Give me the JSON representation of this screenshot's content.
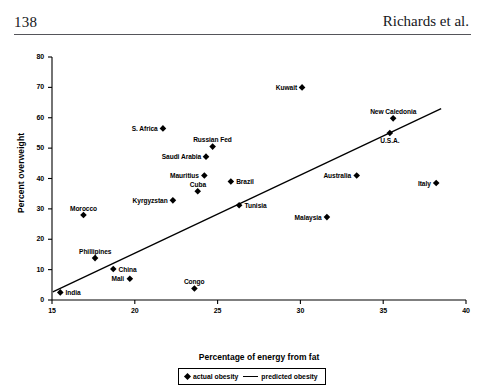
{
  "page": {
    "folio": "138",
    "running_head": "Richards et al."
  },
  "chart_data": {
    "type": "scatter",
    "title": "",
    "xlabel": "Percentage of energy from fat",
    "ylabel": "Percent overweight",
    "xlim": [
      15,
      40
    ],
    "ylim": [
      0,
      80
    ],
    "xticks": [
      "15",
      "20",
      "25",
      "30",
      "35",
      "40"
    ],
    "yticks": [
      "0",
      "10",
      "20",
      "30",
      "40",
      "50",
      "60",
      "70",
      "80"
    ],
    "grid": false,
    "legend_position": "bottom-center",
    "legend": [
      {
        "label": "actual obesity",
        "marker": "diamond"
      },
      {
        "label": "predicted obesity",
        "marker": "line"
      }
    ],
    "series": [
      {
        "name": "actual obesity",
        "marker": "diamond",
        "color": "#000000",
        "points": [
          {
            "label": "India",
            "x": 15.5,
            "y": 2.5,
            "label_side": "right"
          },
          {
            "label": "Morocco",
            "x": 16.9,
            "y": 28.0,
            "label_side": "above"
          },
          {
            "label": "Phillipines",
            "x": 17.6,
            "y": 13.8,
            "label_side": "above"
          },
          {
            "label": "China",
            "x": 18.7,
            "y": 10.2,
            "label_side": "right"
          },
          {
            "label": "Mali",
            "x": 19.7,
            "y": 7.0,
            "label_side": "left"
          },
          {
            "label": "S. Africa",
            "x": 21.7,
            "y": 56.5,
            "label_side": "left"
          },
          {
            "label": "Kyrgyzstan",
            "x": 22.3,
            "y": 32.8,
            "label_side": "left"
          },
          {
            "label": "Congo",
            "x": 23.6,
            "y": 3.8,
            "label_side": "above"
          },
          {
            "label": "Cuba",
            "x": 23.8,
            "y": 35.8,
            "label_side": "above"
          },
          {
            "label": "Mauritius",
            "x": 24.2,
            "y": 41.0,
            "label_side": "left"
          },
          {
            "label": "Saudi Arabia",
            "x": 24.3,
            "y": 47.2,
            "label_side": "left"
          },
          {
            "label": "Russian Fed",
            "x": 24.7,
            "y": 50.5,
            "label_side": "above"
          },
          {
            "label": "Brazil",
            "x": 25.8,
            "y": 39.0,
            "label_side": "right"
          },
          {
            "label": "Tunisia",
            "x": 26.3,
            "y": 31.2,
            "label_side": "right"
          },
          {
            "label": "Kuwait",
            "x": 30.1,
            "y": 70.0,
            "label_side": "left"
          },
          {
            "label": "Malaysia",
            "x": 31.6,
            "y": 27.3,
            "label_side": "left"
          },
          {
            "label": "Australia",
            "x": 33.4,
            "y": 41.0,
            "label_side": "left"
          },
          {
            "label": "New Caledonia",
            "x": 35.6,
            "y": 59.8,
            "label_side": "above"
          },
          {
            "label": "U.S.A.",
            "x": 35.4,
            "y": 55.0,
            "label_side": "below"
          },
          {
            "label": "Italy",
            "x": 38.2,
            "y": 38.5,
            "label_side": "left"
          }
        ]
      },
      {
        "name": "predicted obesity",
        "type": "line",
        "color": "#000000",
        "line": [
          {
            "x": 15.05,
            "y": 2.7
          },
          {
            "x": 38.5,
            "y": 63.0
          }
        ]
      }
    ]
  }
}
